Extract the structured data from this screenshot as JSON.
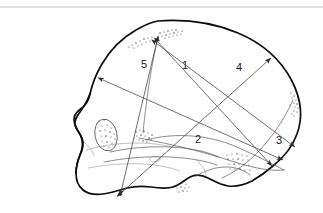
{
  "figure": {
    "background_color": "#ffffff",
    "outline_color": "#0d0d0d",
    "measure_line_color": "#4a4a4a",
    "label_color": "#1a1a1a",
    "top_rule_color": "#b4b4b4"
  },
  "measurements": [
    {
      "id": "m1",
      "label": "1",
      "label_x": 185,
      "label_y": 66,
      "description": "vertex to posterior basal point",
      "x1": 158,
      "y1": 42,
      "x2": 272,
      "y2": 166,
      "arrow_start": true,
      "arrow_end": true
    },
    {
      "id": "m2",
      "label": "2",
      "label_x": 198,
      "label_y": 140,
      "description": "frontal to occipital maximum length",
      "x1": 103,
      "y1": 80,
      "x2": 283,
      "y2": 160,
      "arrow_start": true,
      "arrow_end": true
    },
    {
      "id": "m3",
      "label": "3",
      "label_x": 279,
      "label_y": 141,
      "description": "posterior oblique occipital chord",
      "x1": 156,
      "y1": 43,
      "x2": 295,
      "y2": 147,
      "arrow_start": true,
      "arrow_end": true
    },
    {
      "id": "m4",
      "label": "4",
      "label_x": 239,
      "label_y": 68,
      "description": "basal point to upper parietal eminence",
      "x1": 121,
      "y1": 193,
      "x2": 271,
      "y2": 58,
      "arrow_start": true,
      "arrow_end": true
    },
    {
      "id": "m5",
      "label": "5",
      "label_x": 144,
      "label_y": 65,
      "description": "vertex to skull base vertical height",
      "x1": 157,
      "y1": 41,
      "x2": 120,
      "y2": 196,
      "arrow_start": true,
      "arrow_end": true
    }
  ],
  "landmarks": [
    {
      "id": "bregma-patch",
      "name": "bregma-suture-patch",
      "cx": 160,
      "cy": 36
    },
    {
      "id": "coronal-patch",
      "name": "coronal-suture-patch",
      "cx": 140,
      "cy": 42
    },
    {
      "id": "lambdoid-patch",
      "name": "lambdoid-suture-patch",
      "cx": 294,
      "cy": 104
    },
    {
      "id": "pterion-patch",
      "name": "pterion-patch",
      "cx": 143,
      "cy": 139
    },
    {
      "id": "mastoid-patch",
      "name": "mastoid-process-patch",
      "cx": 237,
      "cy": 163
    },
    {
      "id": "styloid-patch",
      "name": "basal-foramen-patch",
      "cx": 182,
      "cy": 188
    },
    {
      "id": "orbit",
      "name": "orbital-cavity",
      "cx": 106,
      "cy": 135
    }
  ],
  "top_rule": {
    "x1": 0,
    "y1": 7,
    "x2": 323,
    "y2": 7
  }
}
